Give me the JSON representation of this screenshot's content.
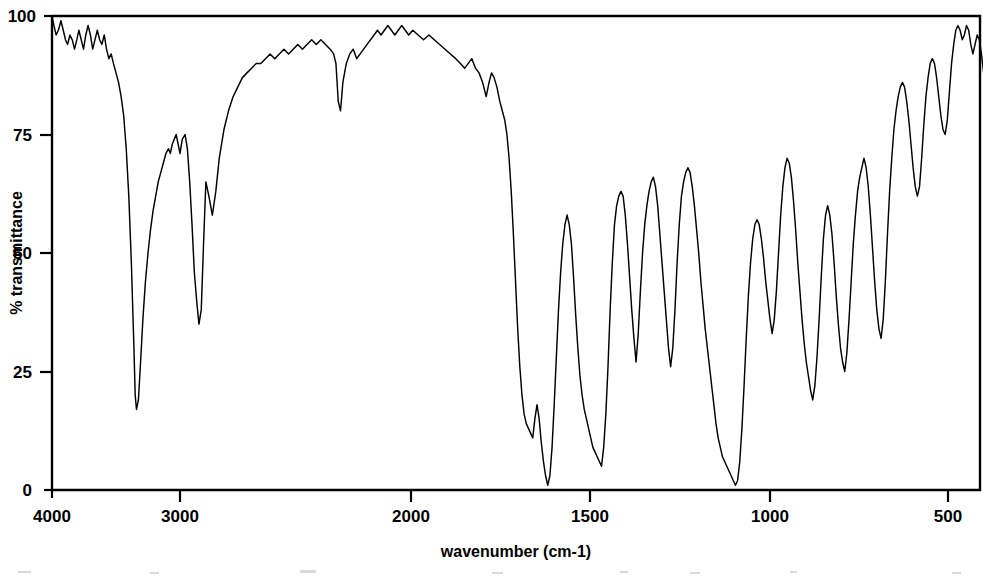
{
  "figure": {
    "kind": "ir-spectrum-plot",
    "background_color": "#ffffff",
    "trace_color": "#000000",
    "axis_color": "#000000"
  },
  "axes": {
    "x_title": "wavenumber (cm-1)",
    "y_title": "% transmittance",
    "x_ticks": [
      "4000",
      "3000",
      "2000",
      "1500",
      "1000",
      "500"
    ],
    "y_ticks": [
      "100",
      "75",
      "50",
      "25",
      "0"
    ]
  },
  "chart_data": {
    "type": "line",
    "title": "",
    "subtitle": "",
    "xlabel": "wavenumber (cm-1)",
    "ylabel": "% transmittance",
    "xlim": [
      4000,
      400
    ],
    "ylim": [
      0,
      100
    ],
    "x_reversed": true,
    "grid": false,
    "legend": null,
    "x_tick_values": [
      4000,
      3000,
      2000,
      1500,
      1000,
      500
    ],
    "x_tick_labels": [
      "4000",
      "3000",
      "2000",
      "1500",
      "1000",
      "500"
    ],
    "y_tick_values": [
      100,
      75,
      50,
      25,
      0
    ],
    "y_tick_labels": [
      "100",
      "75",
      "50",
      "25",
      "0"
    ],
    "x_axis_scale_note": "piecewise: 4000-2000 compressed, 2000-400 expanded",
    "x_pixel_anchors": [
      {
        "wavenumber": 4000,
        "px": 52
      },
      {
        "wavenumber": 3000,
        "px": 180
      },
      {
        "wavenumber": 2000,
        "px": 411
      },
      {
        "wavenumber": 1500,
        "px": 590
      },
      {
        "wavenumber": 1000,
        "px": 770
      },
      {
        "wavenumber": 500,
        "px": 948
      }
    ],
    "series": [
      {
        "name": "transmittance",
        "x": [
          4000,
          3985,
          3968,
          3950,
          3930,
          3912,
          3895,
          3878,
          3860,
          3842,
          3824,
          3806,
          3790,
          3772,
          3754,
          3736,
          3718,
          3700,
          3682,
          3664,
          3646,
          3628,
          3610,
          3592,
          3574,
          3556,
          3538,
          3520,
          3500,
          3480,
          3460,
          3440,
          3420,
          3400,
          3380,
          3360,
          3350,
          3340,
          3325,
          3310,
          3290,
          3270,
          3250,
          3230,
          3210,
          3190,
          3170,
          3150,
          3130,
          3110,
          3090,
          3075,
          3060,
          3045,
          3030,
          3015,
          3000,
          2990,
          2978,
          2968,
          2958,
          2948,
          2938,
          2928,
          2918,
          2908,
          2898,
          2888,
          2875,
          2860,
          2845,
          2830,
          2810,
          2790,
          2770,
          2750,
          2730,
          2710,
          2690,
          2670,
          2650,
          2630,
          2610,
          2590,
          2570,
          2550,
          2530,
          2510,
          2490,
          2470,
          2450,
          2430,
          2410,
          2390,
          2370,
          2350,
          2335,
          2325,
          2315,
          2305,
          2295,
          2280,
          2265,
          2250,
          2235,
          2220,
          2205,
          2190,
          2175,
          2160,
          2145,
          2130,
          2115,
          2100,
          2085,
          2070,
          2055,
          2040,
          2025,
          2010,
          1995,
          1980,
          1965,
          1950,
          1935,
          1920,
          1905,
          1890,
          1875,
          1862,
          1850,
          1840,
          1830,
          1820,
          1810,
          1800,
          1790,
          1782,
          1775,
          1768,
          1760,
          1752,
          1745,
          1738,
          1732,
          1726,
          1720,
          1714,
          1708,
          1702,
          1696,
          1690,
          1684,
          1678,
          1672,
          1666,
          1660,
          1654,
          1648,
          1642,
          1636,
          1630,
          1624,
          1618,
          1612,
          1606,
          1600,
          1594,
          1588,
          1582,
          1576,
          1570,
          1564,
          1558,
          1552,
          1546,
          1540,
          1534,
          1528,
          1522,
          1516,
          1510,
          1504,
          1498,
          1492,
          1486,
          1480,
          1474,
          1468,
          1462,
          1456,
          1450,
          1444,
          1438,
          1432,
          1426,
          1420,
          1414,
          1408,
          1402,
          1396,
          1390,
          1384,
          1378,
          1372,
          1366,
          1360,
          1354,
          1348,
          1342,
          1336,
          1330,
          1324,
          1318,
          1312,
          1306,
          1300,
          1294,
          1288,
          1282,
          1276,
          1270,
          1264,
          1258,
          1252,
          1246,
          1240,
          1234,
          1228,
          1222,
          1216,
          1210,
          1204,
          1198,
          1192,
          1186,
          1180,
          1174,
          1168,
          1162,
          1156,
          1150,
          1144,
          1138,
          1132,
          1126,
          1120,
          1114,
          1108,
          1102,
          1096,
          1090,
          1084,
          1078,
          1072,
          1066,
          1060,
          1054,
          1048,
          1042,
          1036,
          1030,
          1024,
          1018,
          1012,
          1006,
          1000,
          994,
          988,
          982,
          976,
          970,
          964,
          958,
          952,
          946,
          940,
          934,
          928,
          922,
          916,
          910,
          904,
          898,
          892,
          886,
          880,
          874,
          868,
          862,
          856,
          850,
          844,
          838,
          832,
          826,
          820,
          814,
          808,
          802,
          796,
          790,
          784,
          778,
          772,
          766,
          760,
          754,
          748,
          742,
          736,
          730,
          724,
          718,
          712,
          706,
          700,
          694,
          688,
          682,
          676,
          670,
          664,
          658,
          652,
          646,
          640,
          634,
          628,
          622,
          616,
          610,
          604,
          598,
          592,
          586,
          580,
          574,
          568,
          562,
          556,
          550,
          544,
          538,
          532,
          526,
          520,
          514,
          508,
          502,
          496,
          490,
          484,
          478,
          472,
          466,
          460,
          454,
          448,
          442,
          436,
          430,
          424,
          418,
          412,
          406,
          400
        ],
        "y": [
          100,
          98,
          96,
          97,
          99,
          97,
          95,
          94,
          96,
          95,
          93,
          95,
          97,
          95,
          93,
          96,
          98,
          96,
          93,
          95,
          97,
          95,
          94,
          96,
          93,
          91,
          92,
          90,
          88,
          86,
          83,
          79,
          72,
          62,
          48,
          30,
          20,
          17,
          19,
          26,
          36,
          44,
          50,
          55,
          59,
          62,
          65,
          67,
          69,
          71,
          72,
          71,
          73,
          74,
          75,
          73,
          71,
          74,
          75,
          72,
          65,
          56,
          46,
          40,
          35,
          38,
          52,
          65,
          62,
          58,
          63,
          70,
          76,
          80,
          83,
          85,
          87,
          88,
          89,
          90,
          90,
          91,
          92,
          91,
          92,
          93,
          92,
          93,
          94,
          93,
          94,
          95,
          94,
          95,
          94,
          93,
          92,
          90,
          82,
          80,
          86,
          90,
          92,
          93,
          91,
          92,
          93,
          94,
          95,
          96,
          97,
          96,
          97,
          98,
          97,
          96,
          97,
          98,
          97,
          96,
          97,
          96,
          95,
          96,
          95,
          94,
          93,
          92,
          91,
          90,
          89,
          90,
          91,
          89,
          88,
          86,
          83,
          86,
          88,
          87,
          85,
          82,
          80,
          78,
          75,
          70,
          63,
          54,
          44,
          34,
          26,
          20,
          16,
          14,
          13,
          12,
          11,
          15,
          18,
          15,
          10,
          6,
          3,
          1,
          3,
          9,
          18,
          28,
          38,
          46,
          52,
          56,
          58,
          56,
          52,
          45,
          37,
          30,
          24,
          20,
          17,
          15,
          13,
          11,
          9,
          8,
          7,
          6,
          5,
          9,
          16,
          26,
          38,
          48,
          56,
          60,
          62,
          63,
          62,
          58,
          52,
          45,
          38,
          32,
          27,
          33,
          42,
          50,
          56,
          60,
          63,
          65,
          66,
          64,
          60,
          54,
          48,
          42,
          36,
          30,
          26,
          30,
          38,
          48,
          56,
          62,
          65,
          67,
          68,
          67,
          64,
          60,
          55,
          50,
          44,
          39,
          34,
          30,
          26,
          22,
          18,
          14,
          11,
          9,
          7,
          6,
          5,
          4,
          3,
          2,
          1,
          2,
          6,
          13,
          22,
          32,
          41,
          48,
          53,
          56,
          57,
          56,
          53,
          49,
          44,
          40,
          36,
          33,
          36,
          42,
          50,
          58,
          64,
          68,
          70,
          69,
          66,
          61,
          55,
          48,
          42,
          36,
          31,
          27,
          24,
          21,
          19,
          22,
          28,
          36,
          45,
          53,
          58,
          60,
          58,
          54,
          48,
          41,
          35,
          30,
          27,
          25,
          29,
          36,
          44,
          52,
          58,
          63,
          66,
          68,
          70,
          68,
          64,
          58,
          51,
          44,
          38,
          34,
          32,
          36,
          44,
          54,
          63,
          70,
          76,
          80,
          83,
          85,
          86,
          85,
          82,
          78,
          73,
          68,
          64,
          62,
          64,
          70,
          77,
          83,
          87,
          90,
          91,
          90,
          87,
          83,
          79,
          76,
          75,
          78,
          84,
          90,
          94,
          97,
          98,
          97,
          95,
          96,
          98,
          97,
          94,
          92,
          94,
          96,
          95,
          92,
          88
        ],
        "peak_annotations": [
          {
            "wavenumber": 3340,
            "transmittance": 17,
            "assignment": "O-H / N-H stretch"
          },
          {
            "wavenumber": 2930,
            "transmittance": 35,
            "assignment": "C-H stretch"
          },
          {
            "wavenumber": 1700,
            "transmittance": 1,
            "assignment": "C=O stretch"
          },
          {
            "wavenumber": 1610,
            "transmittance": 5,
            "assignment": "aromatic C=C"
          },
          {
            "wavenumber": 1250,
            "transmittance": 1,
            "assignment": "C-O stretch"
          },
          {
            "wavenumber": 750,
            "transmittance": 16,
            "assignment": "aromatic C-H bend"
          }
        ]
      }
    ]
  }
}
